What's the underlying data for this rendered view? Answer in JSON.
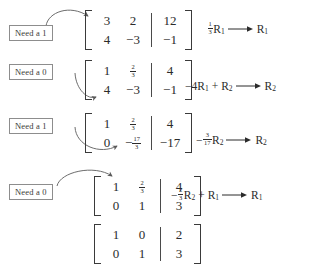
{
  "steps": [
    {
      "annotation": "Need a 1",
      "matrix": {
        "coefficients": [
          [
            "3",
            "2"
          ],
          [
            "4",
            "−3"
          ]
        ],
        "augmented": [
          [
            "12"
          ],
          [
            "−1"
          ]
        ]
      },
      "operation": {
        "text": "⅓R₁ ⟶ R₁",
        "scalar_num": "1",
        "scalar_den": "3",
        "scalar_sign": "",
        "source_row": "R",
        "source_row_sub": "1",
        "added_row": "",
        "added_row_sub": "",
        "target_row": "R",
        "target_row_sub": "1"
      }
    },
    {
      "annotation": "Need a 0",
      "matrix": {
        "coefficients": [
          [
            "1",
            "2/3"
          ],
          [
            "4",
            "−3"
          ]
        ],
        "augmented": [
          [
            "4"
          ],
          [
            "−1"
          ]
        ]
      },
      "operation": {
        "text": "−4R₁ + R₂ ⟶ R₂",
        "scalar_num": "",
        "scalar_den": "",
        "scalar_sign": "−4",
        "source_row": "R",
        "source_row_sub": "1",
        "added_row": "R",
        "added_row_sub": "2",
        "target_row": "R",
        "target_row_sub": "2"
      }
    },
    {
      "annotation": "Need a 1",
      "matrix": {
        "coefficients": [
          [
            "1",
            "2/3"
          ],
          [
            "0",
            "-17/3"
          ]
        ],
        "augmented": [
          [
            "4"
          ],
          [
            "−17"
          ]
        ]
      },
      "operation": {
        "text": "−(3/17)R₂ ⟶ R₂",
        "scalar_num": "3",
        "scalar_den": "17",
        "scalar_sign": "−",
        "source_row": "R",
        "source_row_sub": "2",
        "added_row": "",
        "added_row_sub": "",
        "target_row": "R",
        "target_row_sub": "2"
      }
    },
    {
      "annotation": "Need a 0",
      "matrix": {
        "coefficients": [
          [
            "1",
            "2/3"
          ],
          [
            "0",
            "1"
          ]
        ],
        "augmented": [
          [
            "4"
          ],
          [
            "3"
          ]
        ]
      },
      "operation": {
        "text": "−⅔R₂ + R₁ ⟶ R₁",
        "scalar_num": "2",
        "scalar_den": "3",
        "scalar_sign": "−",
        "source_row": "R",
        "source_row_sub": "2",
        "added_row": "R",
        "added_row_sub": "1",
        "target_row": "R",
        "target_row_sub": "1"
      }
    },
    {
      "annotation": "",
      "matrix": {
        "coefficients": [
          [
            "1",
            "0"
          ],
          [
            "0",
            "1"
          ]
        ],
        "augmented": [
          [
            "2"
          ],
          [
            "3"
          ]
        ]
      },
      "operation": {
        "text": "",
        "scalar_num": "",
        "scalar_den": "",
        "scalar_sign": "",
        "source_row": "",
        "source_row_sub": "",
        "added_row": "",
        "added_row_sub": "",
        "target_row": "",
        "target_row_sub": ""
      }
    }
  ],
  "fractions": {
    "two_thirds": {
      "num": "2",
      "den": "3"
    },
    "neg_seventeen_thirds": {
      "sign": "−",
      "num": "17",
      "den": "3"
    }
  },
  "colors": {
    "ink": "#2b2b2b",
    "rule": "#8d8d8d",
    "background": "#ffffff"
  }
}
